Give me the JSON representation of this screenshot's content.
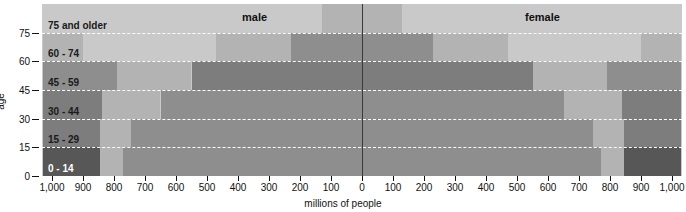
{
  "chart_data": {
    "type": "bar",
    "title": "",
    "subtitle": "",
    "xlabel": "millions of people",
    "ylabel": "age",
    "orientation": "horizontal",
    "pyramid": true,
    "xlim": [
      -1030,
      1030
    ],
    "x_tick_values": [
      -1000,
      -900,
      -800,
      -700,
      -600,
      -500,
      -400,
      -300,
      -200,
      -100,
      0,
      100,
      200,
      300,
      400,
      500,
      600,
      700,
      800,
      900,
      1000
    ],
    "x_tick_labels": [
      "1,000",
      "900",
      "800",
      "700",
      "600",
      "500",
      "400",
      "300",
      "200",
      "100",
      "0",
      "100",
      "200",
      "300",
      "400",
      "500",
      "600",
      "700",
      "800",
      "900",
      "1,000"
    ],
    "y_tick_values": [
      0,
      15,
      30,
      45,
      60,
      75
    ],
    "y_tick_labels": [
      "0",
      "15",
      "30",
      "45",
      "60",
      "75"
    ],
    "grid": "horizontal-dashed-white",
    "legend_position": "inline-top",
    "series_labels": [
      "male",
      "female"
    ],
    "categories": [
      "0 - 14",
      "15 - 29",
      "30 - 44",
      "45 - 59",
      "60 - 74",
      "75 and older"
    ],
    "series": [
      {
        "name": "male",
        "values": [
          1000,
          960,
          930,
          770,
          480,
          210
        ]
      },
      {
        "name": "female",
        "values": [
          1000,
          960,
          930,
          770,
          480,
          210
        ]
      }
    ],
    "shade_levels": {
      "darkest": "#575757",
      "dark": "#7d7d7d",
      "medium": "#8e8e8e",
      "light": "#b3b3b3",
      "lightest": "#c9c9c9"
    },
    "bands": [
      {
        "category": "75 and older",
        "label": "75 and older",
        "label_on_dark": false,
        "male_segments": [
          {
            "from": -1030,
            "to": -130,
            "shade": "lightest"
          },
          {
            "from": -130,
            "to": 0,
            "shade": "light"
          }
        ],
        "female_segments": [
          {
            "from": 0,
            "to": 130,
            "shade": "light"
          },
          {
            "from": 130,
            "to": 1030,
            "shade": "lightest"
          }
        ]
      },
      {
        "category": "60 - 74",
        "label": "60 - 74",
        "label_on_dark": false,
        "male_segments": [
          {
            "from": -1030,
            "to": -900,
            "shade": "light"
          },
          {
            "from": -900,
            "to": -470,
            "shade": "lightest"
          },
          {
            "from": -470,
            "to": -230,
            "shade": "light"
          },
          {
            "from": -230,
            "to": 0,
            "shade": "medium"
          }
        ],
        "female_segments": [
          {
            "from": 0,
            "to": 230,
            "shade": "medium"
          },
          {
            "from": 230,
            "to": 470,
            "shade": "light"
          },
          {
            "from": 470,
            "to": 900,
            "shade": "lightest"
          },
          {
            "from": 900,
            "to": 1030,
            "shade": "light"
          }
        ]
      },
      {
        "category": "45 - 59",
        "label": "45 - 59",
        "label_on_dark": false,
        "male_segments": [
          {
            "from": -1030,
            "to": -790,
            "shade": "medium"
          },
          {
            "from": -790,
            "to": -550,
            "shade": "light"
          },
          {
            "from": -550,
            "to": 0,
            "shade": "dark"
          }
        ],
        "female_segments": [
          {
            "from": 0,
            "to": 550,
            "shade": "dark"
          },
          {
            "from": 550,
            "to": 790,
            "shade": "light"
          },
          {
            "from": 790,
            "to": 1030,
            "shade": "medium"
          }
        ]
      },
      {
        "category": "30 - 44",
        "label": "30 - 44",
        "label_on_dark": false,
        "male_segments": [
          {
            "from": -1030,
            "to": -840,
            "shade": "dark"
          },
          {
            "from": -840,
            "to": -650,
            "shade": "light"
          },
          {
            "from": -650,
            "to": 0,
            "shade": "medium"
          }
        ],
        "female_segments": [
          {
            "from": 0,
            "to": 650,
            "shade": "medium"
          },
          {
            "from": 650,
            "to": 840,
            "shade": "light"
          },
          {
            "from": 840,
            "to": 1030,
            "shade": "dark"
          }
        ]
      },
      {
        "category": "15 - 29",
        "label": "15 - 29",
        "label_on_dark": false,
        "male_segments": [
          {
            "from": -1030,
            "to": -845,
            "shade": "dark"
          },
          {
            "from": -845,
            "to": -745,
            "shade": "light"
          },
          {
            "from": -745,
            "to": 0,
            "shade": "medium"
          }
        ],
        "female_segments": [
          {
            "from": 0,
            "to": 745,
            "shade": "medium"
          },
          {
            "from": 745,
            "to": 845,
            "shade": "light"
          },
          {
            "from": 845,
            "to": 1030,
            "shade": "dark"
          }
        ]
      },
      {
        "category": "0 - 14",
        "label": "0 - 14",
        "label_on_dark": true,
        "male_segments": [
          {
            "from": -1030,
            "to": -845,
            "shade": "darkest"
          },
          {
            "from": -845,
            "to": -770,
            "shade": "light"
          },
          {
            "from": -770,
            "to": 0,
            "shade": "medium"
          }
        ],
        "female_segments": [
          {
            "from": 0,
            "to": 770,
            "shade": "medium"
          },
          {
            "from": 770,
            "to": 845,
            "shade": "light"
          },
          {
            "from": 845,
            "to": 1030,
            "shade": "darkest"
          }
        ]
      }
    ]
  },
  "axes": {
    "y_axis_title": "age",
    "x_axis_title": "millions of people"
  },
  "annotations": {
    "male_label": "male",
    "female_label": "female"
  }
}
